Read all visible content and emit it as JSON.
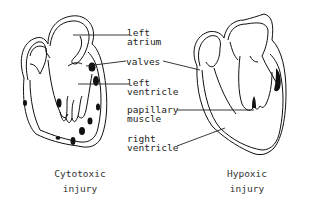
{
  "labels": {
    "left_atrium": [
      "left",
      "atrium"
    ],
    "valves": "valves",
    "left_ventricle": [
      "left",
      "ventricle"
    ],
    "papillary_muscle": [
      "papillary",
      "muscle"
    ],
    "right_ventricle": [
      "right",
      "ventricle"
    ]
  },
  "captions": {
    "left": [
      "Cytotoxic",
      "injury"
    ],
    "right": [
      "Hypoxic",
      "injury"
    ]
  },
  "colors": {
    "ink": "#111111",
    "background": "#ffffff"
  }
}
